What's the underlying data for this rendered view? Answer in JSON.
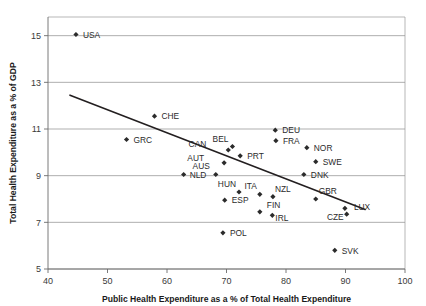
{
  "chart_data": {
    "type": "scatter",
    "title": "",
    "xlabel": "Public Health Expenditure as a % of Total Health Expenditure",
    "ylabel": "Total Health Expenditure as a % of GDP",
    "xlim": [
      40,
      100
    ],
    "ylim": [
      5,
      15.8
    ],
    "xticks": [
      40,
      50,
      60,
      70,
      80,
      90,
      100
    ],
    "xticklabels": [
      "40",
      "50",
      "60",
      "70",
      "80",
      "90",
      "100"
    ],
    "yticks": [
      5,
      7,
      9,
      11,
      13,
      15
    ],
    "yticklabels": [
      "5",
      "7",
      "9",
      "11",
      "13",
      "15"
    ],
    "grid": "horizontal",
    "legend": "none",
    "marker_shape": "diamond",
    "marker_color": "#2b2b2b",
    "trendline": {
      "visible": true,
      "color": "#231f20",
      "x_start": 43.7,
      "y_start": 12.45,
      "x_end": 93.3,
      "y_end": 7.55
    },
    "points": [
      {
        "label": "USA",
        "x": 44.7,
        "y": 15.05,
        "lx": 7,
        "ly": 3.2
      },
      {
        "label": "CHE",
        "x": 57.9,
        "y": 11.55,
        "lx": 7,
        "ly": 3.2
      },
      {
        "label": "GRC",
        "x": 53.2,
        "y": 10.55,
        "lx": 7,
        "ly": 3.2
      },
      {
        "label": "DEU",
        "x": 78.2,
        "y": 10.95,
        "lx": 7,
        "ly": 3.2
      },
      {
        "label": "FRA",
        "x": 78.3,
        "y": 10.5,
        "lx": 7,
        "ly": 3.2
      },
      {
        "label": "NOR",
        "x": 83.5,
        "y": 10.2,
        "lx": 7,
        "ly": 3.2
      },
      {
        "label": "BEL",
        "x": 71.0,
        "y": 10.25,
        "lx": -4,
        "ly": -5
      },
      {
        "label": "CAN",
        "x": 70.3,
        "y": 10.1,
        "lx": -22,
        "ly": -3
      },
      {
        "label": "PRT",
        "x": 72.3,
        "y": 9.85,
        "lx": 7,
        "ly": 3.2
      },
      {
        "label": "SWE",
        "x": 85.0,
        "y": 9.6,
        "lx": 7,
        "ly": 3.2
      },
      {
        "label": "AUT",
        "x": 69.6,
        "y": 9.55,
        "lx": -20,
        "ly": -2
      },
      {
        "label": "NLD",
        "x": 62.8,
        "y": 9.05,
        "lx": 6,
        "ly": 3.2
      },
      {
        "label": "AUS",
        "x": 68.2,
        "y": 9.05,
        "lx": -6,
        "ly": -5.5
      },
      {
        "label": "DNK",
        "x": 83.0,
        "y": 9.05,
        "lx": 7,
        "ly": 3.2
      },
      {
        "label": "HUN",
        "x": 72.1,
        "y": 8.3,
        "lx": -3,
        "ly": -5.5
      },
      {
        "label": "ITA",
        "x": 75.6,
        "y": 8.2,
        "lx": -3,
        "ly": -5.5
      },
      {
        "label": "NZL",
        "x": 77.8,
        "y": 8.1,
        "lx": 2,
        "ly": -5
      },
      {
        "label": "ESP",
        "x": 69.7,
        "y": 7.95,
        "lx": 7,
        "ly": 3.2
      },
      {
        "label": "GBR",
        "x": 85.0,
        "y": 8.0,
        "lx": 3,
        "ly": -5.5
      },
      {
        "label": "FIN",
        "x": 75.6,
        "y": 7.45,
        "lx": 7,
        "ly": -4
      },
      {
        "label": "IRL",
        "x": 77.7,
        "y": 7.3,
        "lx": 3,
        "ly": 5.5
      },
      {
        "label": "LUX",
        "x": 89.9,
        "y": 7.6,
        "lx": 9,
        "ly": 2
      },
      {
        "label": "CZE",
        "x": 90.2,
        "y": 7.35,
        "lx": -3,
        "ly": 6
      },
      {
        "label": "POL",
        "x": 69.4,
        "y": 6.55,
        "lx": 7,
        "ly": 3.2
      },
      {
        "label": "SVK",
        "x": 88.2,
        "y": 5.8,
        "lx": 7,
        "ly": 3.2
      }
    ]
  }
}
